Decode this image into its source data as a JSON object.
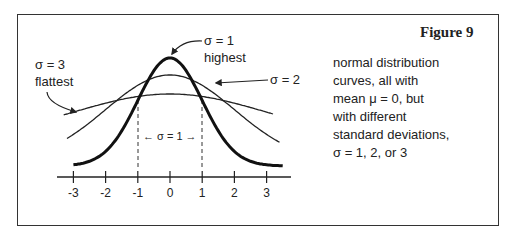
{
  "figure": {
    "title": "Figure 9",
    "description_lines": [
      "normal distribution",
      "curves, all with",
      "mean μ = 0, but",
      "with different",
      "standard deviations,",
      "σ = 1, 2, or 3"
    ]
  },
  "annotations": {
    "sigma1_label": "σ = 1",
    "sigma1_sub": "highest",
    "sigma2_label": "σ = 2",
    "sigma3_label": "σ = 3",
    "sigma3_sub": "flattest",
    "interval_label": "← σ = 1 →"
  },
  "axis": {
    "ticks": [
      "-3",
      "-2",
      "-1",
      "0",
      "1",
      "2",
      "3"
    ]
  },
  "chart_data": {
    "type": "line",
    "title": "Figure 9",
    "xlabel": "",
    "ylabel": "",
    "xlim": [
      -3.5,
      3.5
    ],
    "x_ticks": [
      -3,
      -2,
      -1,
      0,
      1,
      2,
      3
    ],
    "grid": false,
    "series": [
      {
        "name": "σ = 1 (highest)",
        "mean": 0,
        "sd": 1,
        "style": "thick"
      },
      {
        "name": "σ = 2",
        "mean": 0,
        "sd": 2,
        "style": "thin"
      },
      {
        "name": "σ = 3 (flattest)",
        "mean": 0,
        "sd": 3,
        "style": "thin"
      }
    ],
    "annotations": [
      "dashed verticals at x = -1 and x = 1 labeled ← σ = 1 →"
    ]
  }
}
